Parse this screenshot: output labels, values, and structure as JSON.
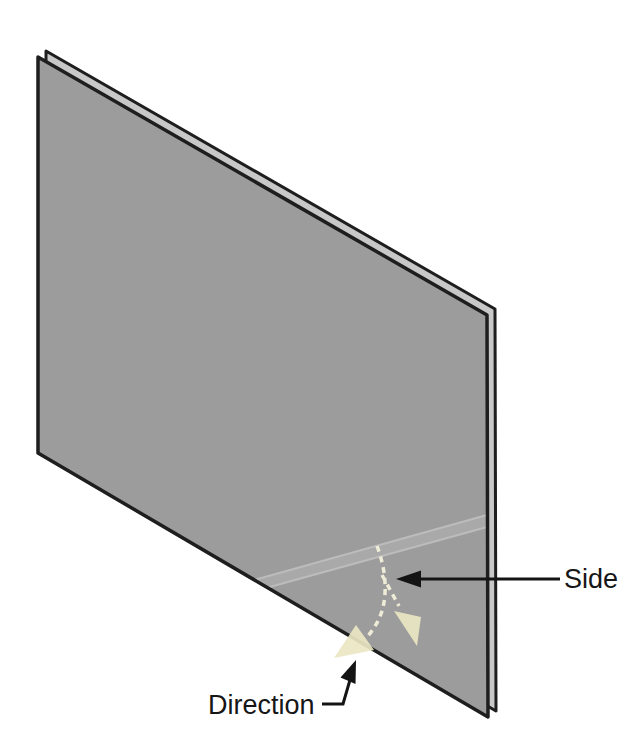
{
  "figure": {
    "type": "technical-illustration",
    "labels": {
      "side": "Side",
      "direction": "Direction"
    },
    "icons": {
      "side_callout": "left-arrow-icon",
      "direction_callout": "up-right-arrow-icon",
      "bend_direction": "curved-down-left-arrow-icon",
      "side_direction": "diagonal-down-right-arrow-icon"
    },
    "colors": {
      "background": "#ffffff",
      "plate_face": "#9c9c9c",
      "plate_side_face": "#c8c8c8",
      "outline": "#1e1e1e",
      "bend_band_fill": "#a9a9a9",
      "bend_band_edge": "#bcbcbc",
      "arrow_fill": "#ebe7c4",
      "arrow_dash": "#f6f3dc",
      "callout": "#141414"
    }
  }
}
